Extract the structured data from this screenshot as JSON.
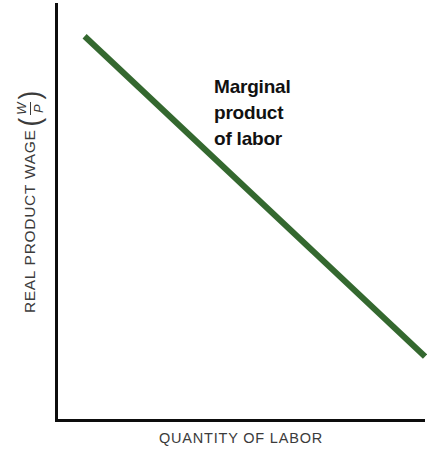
{
  "figure": {
    "background": "#ffffff",
    "width": 427,
    "height": 455
  },
  "axes": {
    "color": "#0d0d0d",
    "y_label_text": "REAL PRODUCT WAGE",
    "y_label_fraction_numerator": "W",
    "y_label_fraction_denominator": "P",
    "y_label_paren_open": "(",
    "y_label_paren_close": ")",
    "x_label": "QUANTITY OF LABOR"
  },
  "annotation": {
    "line1": "Marginal",
    "line2": "product",
    "line3": "of labor",
    "color": "#111111"
  },
  "chart_data": {
    "type": "line",
    "title": "",
    "xlabel": "QUANTITY OF LABOR",
    "ylabel": "REAL PRODUCT WAGE (W/P)",
    "grid": false,
    "legend": "none",
    "xlim": [
      0,
      100
    ],
    "ylim": [
      0,
      100
    ],
    "axis_ticks": [],
    "series": [
      {
        "name": "Marginal product of labor",
        "color": "#34682f",
        "linewidth": 6,
        "x": [
          8,
          100
        ],
        "y": [
          92,
          15
        ],
        "description": "Downward-sloping straight line representing the marginal product of labor curve"
      }
    ],
    "annotations": [
      {
        "text": "Marginal product of labor",
        "x": 45,
        "y": 80
      }
    ]
  }
}
